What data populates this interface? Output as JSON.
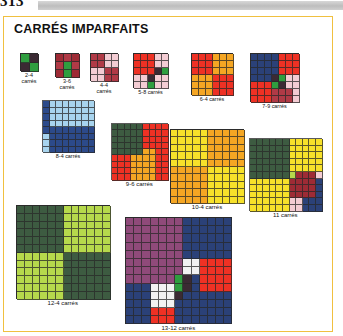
{
  "page": {
    "number": "313"
  },
  "panel": {
    "title": "CARRÉS IMPARFAITS"
  },
  "palette": {
    "green": "#2f9e3f",
    "dark_green": "#3d5b41",
    "light_green": "#b6d94c",
    "maroon": "#3b2a33",
    "dark_red": "#9e2b35",
    "mid_red": "#b03a46",
    "pink": "#f3ccd3",
    "pale_pink": "#f7dde1",
    "red": "#ee3124",
    "orange": "#f5a623",
    "light_orange": "#f6a94a",
    "yellow": "#f7e12a",
    "blue": "#2c4a8a",
    "navy": "#2b4178",
    "light_blue": "#a8d4ee",
    "purple": "#8f4a7a",
    "white": "#f2f2f2"
  },
  "figures": [
    {
      "id": "fig-2-4",
      "caption": "2-4\ncarrés",
      "order": 2,
      "cell": 9,
      "x": 16,
      "y": 36,
      "cells": [
        "green",
        "maroon",
        "maroon",
        "green"
      ]
    },
    {
      "id": "fig-3-6",
      "caption": "3-6\ncarrés",
      "order": 3,
      "cell": 8,
      "x": 51,
      "y": 36,
      "cells": [
        "dark_red",
        "mid_red",
        "dark_red",
        "mid_red",
        "green",
        "mid_red",
        "dark_red",
        "green",
        "dark_red"
      ]
    },
    {
      "id": "fig-4-4",
      "caption": "4-4\ncarrés",
      "order": 4,
      "cell": 7,
      "x": 86,
      "y": 36,
      "cells": [
        "mid_red",
        "mid_red",
        "pink",
        "pink",
        "mid_red",
        "mid_red",
        "pink",
        "pink",
        "pink",
        "pink",
        "mid_red",
        "mid_red",
        "pink",
        "pink",
        "mid_red",
        "mid_red"
      ]
    },
    {
      "id": "fig-5-8",
      "caption": "5-8 carrés",
      "order": 5,
      "cell": 7,
      "x": 129,
      "y": 36,
      "cells": [
        "red",
        "red",
        "red",
        "pink",
        "pink",
        "red",
        "red",
        "red",
        "pink",
        "pink",
        "red",
        "red",
        "red",
        "maroon",
        "green",
        "pink",
        "pink",
        "maroon",
        "pink",
        "pink",
        "pink",
        "pink",
        "green",
        "pink",
        "pink"
      ]
    },
    {
      "id": "fig-6-4",
      "caption": "6-4 carrés",
      "order": 6,
      "cell": 7,
      "x": 187,
      "y": 36,
      "cells": [
        "red",
        "red",
        "red",
        "orange",
        "orange",
        "orange",
        "red",
        "red",
        "red",
        "orange",
        "orange",
        "orange",
        "red",
        "red",
        "red",
        "orange",
        "orange",
        "orange",
        "orange",
        "orange",
        "orange",
        "red",
        "red",
        "red",
        "orange",
        "orange",
        "orange",
        "red",
        "red",
        "red",
        "orange",
        "orange",
        "orange",
        "red",
        "red",
        "red"
      ]
    },
    {
      "id": "fig-7-9",
      "caption": "7-9 carrés",
      "order": 7,
      "cell": 7,
      "x": 246,
      "y": 36,
      "cells": [
        "navy",
        "navy",
        "navy",
        "navy",
        "red",
        "red",
        "red",
        "navy",
        "navy",
        "navy",
        "navy",
        "red",
        "red",
        "red",
        "navy",
        "navy",
        "navy",
        "navy",
        "red",
        "red",
        "red",
        "navy",
        "navy",
        "navy",
        "maroon",
        "green",
        "pink",
        "pink",
        "red",
        "red",
        "red",
        "green",
        "maroon",
        "pink",
        "pink",
        "red",
        "red",
        "red",
        "mid_red",
        "mid_red",
        "mid_red",
        "pink",
        "red",
        "red",
        "red",
        "mid_red",
        "mid_red",
        "mid_red",
        "pink"
      ]
    },
    {
      "id": "fig-8-4",
      "caption": "8-4 carrés",
      "order": 8,
      "cell": 6.5,
      "x": 38,
      "y": 83,
      "cells": [
        "blue",
        "light_blue",
        "light_blue",
        "light_blue",
        "light_blue",
        "light_blue",
        "light_blue",
        "light_blue",
        "blue",
        "light_blue",
        "light_blue",
        "light_blue",
        "light_blue",
        "light_blue",
        "light_blue",
        "light_blue",
        "blue",
        "light_blue",
        "light_blue",
        "light_blue",
        "light_blue",
        "light_blue",
        "light_blue",
        "light_blue",
        "blue",
        "light_blue",
        "light_blue",
        "light_blue",
        "light_blue",
        "light_blue",
        "light_blue",
        "light_blue",
        "blue",
        "blue",
        "blue",
        "blue",
        "blue",
        "blue",
        "blue",
        "blue",
        "light_blue",
        "blue",
        "blue",
        "blue",
        "blue",
        "blue",
        "blue",
        "blue",
        "light_blue",
        "blue",
        "blue",
        "blue",
        "blue",
        "blue",
        "blue",
        "blue",
        "light_blue",
        "blue",
        "blue",
        "blue",
        "blue",
        "blue",
        "blue",
        "blue"
      ]
    },
    {
      "id": "fig-9-6",
      "caption": "9-6 carrés",
      "order": 9,
      "cell": 6.3,
      "x": 107,
      "y": 106,
      "cells": [
        "dark_green",
        "dark_green",
        "dark_green",
        "dark_green",
        "dark_green",
        "red",
        "red",
        "red",
        "red",
        "dark_green",
        "dark_green",
        "dark_green",
        "dark_green",
        "dark_green",
        "red",
        "red",
        "red",
        "red",
        "dark_green",
        "dark_green",
        "dark_green",
        "dark_green",
        "dark_green",
        "red",
        "red",
        "red",
        "red",
        "dark_green",
        "dark_green",
        "dark_green",
        "dark_green",
        "dark_green",
        "red",
        "red",
        "red",
        "red",
        "dark_green",
        "dark_green",
        "dark_green",
        "dark_green",
        "dark_green",
        "orange",
        "orange",
        "red",
        "red",
        "red",
        "red",
        "red",
        "orange",
        "orange",
        "orange",
        "orange",
        "red",
        "red",
        "red",
        "red",
        "red",
        "orange",
        "orange",
        "orange",
        "orange",
        "red",
        "red",
        "red",
        "red",
        "red",
        "orange",
        "orange",
        "orange",
        "orange",
        "red",
        "red",
        "red",
        "red",
        "red",
        "orange",
        "orange",
        "orange",
        "orange",
        "red",
        "red"
      ]
    },
    {
      "id": "fig-10-4",
      "caption": "10-4 carrés",
      "order": 10,
      "cell": 7.4,
      "x": 166,
      "y": 112,
      "cells": [
        "yellow",
        "yellow",
        "yellow",
        "yellow",
        "yellow",
        "orange",
        "orange",
        "orange",
        "orange",
        "orange",
        "yellow",
        "yellow",
        "yellow",
        "yellow",
        "yellow",
        "orange",
        "orange",
        "orange",
        "orange",
        "orange",
        "yellow",
        "yellow",
        "yellow",
        "yellow",
        "yellow",
        "orange",
        "orange",
        "orange",
        "orange",
        "orange",
        "yellow",
        "yellow",
        "yellow",
        "yellow",
        "yellow",
        "orange",
        "orange",
        "orange",
        "orange",
        "orange",
        "yellow",
        "yellow",
        "yellow",
        "yellow",
        "yellow",
        "orange",
        "orange",
        "orange",
        "orange",
        "orange",
        "orange",
        "orange",
        "orange",
        "orange",
        "orange",
        "yellow",
        "yellow",
        "yellow",
        "yellow",
        "yellow",
        "orange",
        "orange",
        "orange",
        "orange",
        "orange",
        "yellow",
        "yellow",
        "yellow",
        "yellow",
        "yellow",
        "orange",
        "orange",
        "orange",
        "orange",
        "orange",
        "yellow",
        "yellow",
        "yellow",
        "yellow",
        "yellow",
        "orange",
        "orange",
        "orange",
        "orange",
        "orange",
        "yellow",
        "yellow",
        "yellow",
        "yellow",
        "yellow",
        "orange",
        "orange",
        "orange",
        "orange",
        "orange",
        "yellow",
        "yellow",
        "yellow",
        "yellow",
        "yellow"
      ]
    },
    {
      "id": "fig-11",
      "caption": "11 carrés",
      "order": 11,
      "cell": 6.6,
      "x": 245,
      "y": 121,
      "cells": [
        "dark_green",
        "dark_green",
        "dark_green",
        "dark_green",
        "dark_green",
        "dark_green",
        "yellow",
        "yellow",
        "yellow",
        "yellow",
        "yellow",
        "dark_green",
        "dark_green",
        "dark_green",
        "dark_green",
        "dark_green",
        "dark_green",
        "yellow",
        "yellow",
        "yellow",
        "yellow",
        "yellow",
        "dark_green",
        "dark_green",
        "dark_green",
        "dark_green",
        "dark_green",
        "dark_green",
        "yellow",
        "yellow",
        "yellow",
        "yellow",
        "yellow",
        "dark_green",
        "dark_green",
        "dark_green",
        "dark_green",
        "dark_green",
        "dark_green",
        "yellow",
        "yellow",
        "yellow",
        "yellow",
        "yellow",
        "dark_green",
        "dark_green",
        "dark_green",
        "dark_green",
        "dark_green",
        "dark_green",
        "yellow",
        "yellow",
        "yellow",
        "yellow",
        "yellow",
        "dark_green",
        "dark_green",
        "dark_green",
        "dark_green",
        "dark_green",
        "dark_green",
        "light_green",
        "dark_red",
        "dark_red",
        "dark_red",
        "pink",
        "yellow",
        "yellow",
        "yellow",
        "yellow",
        "yellow",
        "yellow",
        "dark_red",
        "dark_red",
        "dark_red",
        "dark_red",
        "navy",
        "yellow",
        "yellow",
        "yellow",
        "yellow",
        "yellow",
        "yellow",
        "dark_red",
        "dark_red",
        "dark_red",
        "dark_red",
        "navy",
        "yellow",
        "yellow",
        "yellow",
        "yellow",
        "yellow",
        "yellow",
        "dark_red",
        "dark_red",
        "dark_red",
        "dark_red",
        "navy",
        "yellow",
        "yellow",
        "yellow",
        "yellow",
        "yellow",
        "yellow",
        "pink",
        "pink",
        "navy",
        "navy",
        "navy",
        "yellow",
        "yellow",
        "yellow",
        "yellow",
        "yellow",
        "yellow",
        "pink",
        "pink",
        "navy",
        "navy",
        "navy"
      ]
    },
    {
      "id": "fig-12-4",
      "caption": "12-4 carrés",
      "order": 12,
      "cell": 7.8,
      "x": 12,
      "y": 188,
      "cells": [
        "dark_green",
        "dark_green",
        "dark_green",
        "dark_green",
        "dark_green",
        "dark_green",
        "light_green",
        "light_green",
        "light_green",
        "light_green",
        "light_green",
        "light_green",
        "dark_green",
        "dark_green",
        "dark_green",
        "dark_green",
        "dark_green",
        "dark_green",
        "light_green",
        "light_green",
        "light_green",
        "light_green",
        "light_green",
        "light_green",
        "dark_green",
        "dark_green",
        "dark_green",
        "dark_green",
        "dark_green",
        "dark_green",
        "light_green",
        "light_green",
        "light_green",
        "light_green",
        "light_green",
        "light_green",
        "dark_green",
        "dark_green",
        "dark_green",
        "dark_green",
        "dark_green",
        "dark_green",
        "light_green",
        "light_green",
        "light_green",
        "light_green",
        "light_green",
        "light_green",
        "dark_green",
        "dark_green",
        "dark_green",
        "dark_green",
        "dark_green",
        "dark_green",
        "light_green",
        "light_green",
        "light_green",
        "light_green",
        "light_green",
        "light_green",
        "dark_green",
        "dark_green",
        "dark_green",
        "dark_green",
        "dark_green",
        "dark_green",
        "light_green",
        "light_green",
        "light_green",
        "light_green",
        "light_green",
        "light_green",
        "light_green",
        "light_green",
        "light_green",
        "light_green",
        "light_green",
        "light_green",
        "dark_green",
        "dark_green",
        "dark_green",
        "dark_green",
        "dark_green",
        "dark_green",
        "light_green",
        "light_green",
        "light_green",
        "light_green",
        "light_green",
        "light_green",
        "dark_green",
        "dark_green",
        "dark_green",
        "dark_green",
        "dark_green",
        "dark_green",
        "light_green",
        "light_green",
        "light_green",
        "light_green",
        "light_green",
        "light_green",
        "dark_green",
        "dark_green",
        "dark_green",
        "dark_green",
        "dark_green",
        "dark_green",
        "light_green",
        "light_green",
        "light_green",
        "light_green",
        "light_green",
        "light_green",
        "dark_green",
        "dark_green",
        "dark_green",
        "dark_green",
        "dark_green",
        "dark_green",
        "light_green",
        "light_green",
        "light_green",
        "light_green",
        "light_green",
        "light_green",
        "dark_green",
        "dark_green",
        "dark_green",
        "dark_green",
        "dark_green",
        "dark_green",
        "light_green",
        "light_green",
        "light_green",
        "light_green",
        "light_green",
        "light_green",
        "dark_green",
        "dark_green",
        "dark_green",
        "dark_green",
        "dark_green",
        "dark_green"
      ]
    },
    {
      "id": "fig-13-12",
      "caption": "13-12 carrés",
      "order": 13,
      "cell": 8.2,
      "x": 121,
      "y": 200,
      "cells": [
        "purple",
        "purple",
        "purple",
        "purple",
        "purple",
        "purple",
        "purple",
        "navy",
        "navy",
        "navy",
        "navy",
        "navy",
        "navy",
        "purple",
        "purple",
        "purple",
        "purple",
        "purple",
        "purple",
        "purple",
        "navy",
        "navy",
        "navy",
        "navy",
        "navy",
        "navy",
        "purple",
        "purple",
        "purple",
        "purple",
        "purple",
        "purple",
        "purple",
        "navy",
        "navy",
        "navy",
        "navy",
        "navy",
        "navy",
        "purple",
        "purple",
        "purple",
        "purple",
        "purple",
        "purple",
        "purple",
        "navy",
        "navy",
        "navy",
        "navy",
        "navy",
        "navy",
        "purple",
        "purple",
        "purple",
        "purple",
        "purple",
        "purple",
        "purple",
        "navy",
        "navy",
        "navy",
        "navy",
        "navy",
        "navy",
        "purple",
        "purple",
        "purple",
        "purple",
        "purple",
        "purple",
        "purple",
        "white",
        "white",
        "red",
        "red",
        "red",
        "red",
        "purple",
        "purple",
        "purple",
        "purple",
        "purple",
        "purple",
        "purple",
        "white",
        "white",
        "red",
        "red",
        "red",
        "red",
        "purple",
        "purple",
        "purple",
        "purple",
        "purple",
        "purple",
        "green",
        "maroon",
        "navy",
        "red",
        "red",
        "red",
        "red",
        "navy",
        "navy",
        "navy",
        "white",
        "white",
        "white",
        "green",
        "maroon",
        "navy",
        "red",
        "red",
        "red",
        "red",
        "navy",
        "navy",
        "navy",
        "white",
        "white",
        "white",
        "maroon",
        "navy",
        "navy",
        "navy",
        "navy",
        "navy",
        "navy",
        "navy",
        "navy",
        "navy",
        "white",
        "white",
        "white",
        "navy",
        "navy",
        "navy",
        "navy",
        "navy",
        "navy",
        "navy",
        "navy",
        "navy",
        "navy",
        "red",
        "red",
        "red",
        "navy",
        "navy",
        "navy",
        "navy",
        "navy",
        "navy",
        "navy",
        "navy",
        "navy",
        "navy",
        "red",
        "red",
        "red",
        "navy",
        "navy",
        "navy",
        "navy",
        "navy",
        "navy",
        "navy"
      ]
    }
  ]
}
